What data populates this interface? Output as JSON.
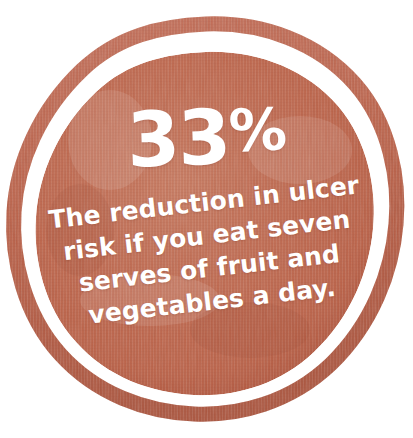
{
  "badge": {
    "type": "statistic-badge",
    "shape": "circular-stamp",
    "headline": {
      "number": "33",
      "unit": "%",
      "full": "33%"
    },
    "caption": {
      "full_text": "The reduction in ulcer risk if you eat seven serves of fruit and vegetables a day.",
      "lines": [
        "The reduction in ulcer",
        "risk if you eat seven",
        "serves of fruit and",
        "vegetables a day."
      ]
    },
    "colors": {
      "background": "#ffffff",
      "fill": "#bd6349",
      "fill_light": "#c87a60",
      "fill_dark": "#a8503a",
      "ring": "#bb6148",
      "text": "#ffffff"
    },
    "geometry": {
      "outer_ring_label": "outer-ring",
      "inner_disc_label": "inner-disc",
      "gap_label": "white-gap"
    }
  }
}
